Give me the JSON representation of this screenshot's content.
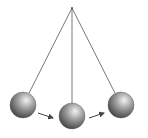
{
  "diagram": {
    "type": "pendulum-motion",
    "pivot": {
      "x": 72,
      "y": 8
    },
    "string_color": "#555555",
    "arrow_color": "#444444",
    "ball_colors": {
      "highlight": "#f2f2f2",
      "mid": "#9a9a9a",
      "shadow": "#3c3c3c"
    },
    "balls": [
      {
        "id": "left",
        "cx": 23,
        "cy": 105,
        "r": 13
      },
      {
        "id": "center",
        "cx": 72,
        "cy": 116,
        "r": 13
      },
      {
        "id": "right",
        "cx": 121,
        "cy": 105,
        "r": 13
      }
    ],
    "arrows": [
      {
        "from": "left",
        "x1": 38,
        "y1": 113,
        "x2": 53,
        "y2": 118
      },
      {
        "from": "center",
        "x1": 89,
        "y1": 118,
        "x2": 104,
        "y2": 113
      }
    ]
  }
}
